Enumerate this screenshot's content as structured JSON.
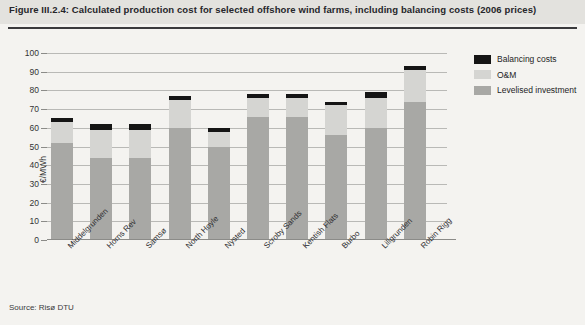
{
  "header": {
    "title": "Figure III.2.4: Calculated production cost for selected offshore wind farms, including balancing costs (2006 prices)"
  },
  "source": {
    "note": "Source: Risø DTU"
  },
  "legend": {
    "position": "top-right",
    "items": [
      {
        "label": "Balancing costs",
        "color": "#151515"
      },
      {
        "label": "O&M",
        "color": "#d5d5d2"
      },
      {
        "label": "Levelised investment",
        "color": "#a8a8a5"
      }
    ]
  },
  "axis": {
    "ylabel": "€/MWh",
    "yticks": [
      "0",
      "10",
      "20",
      "30",
      "40",
      "50",
      "60",
      "70",
      "80",
      "90",
      "100"
    ]
  },
  "chart_data": {
    "type": "bar",
    "title": "Calculated production cost for selected offshore wind farms, including balancing costs (2006 prices)",
    "subtitle": "",
    "xlabel": "",
    "ylabel": "€/MWh",
    "ylim": [
      0,
      100
    ],
    "ytick_step": 10,
    "grid": true,
    "stacked": true,
    "legend_position": "top-right",
    "categories": [
      "Middelgrunden",
      "Horns Rev",
      "Samsø",
      "North Hoyle",
      "Nysted",
      "Scroby Sands",
      "Kentish Flats",
      "Burbo",
      "Lillgrunden",
      "Robin Rigg"
    ],
    "series": [
      {
        "name": "Levelised investment",
        "color": "#a8a8a5",
        "values": [
          52,
          44,
          44,
          60,
          50,
          66,
          66,
          56,
          60,
          74
        ]
      },
      {
        "name": "O&M",
        "color": "#d5d5d2",
        "values": [
          11,
          15,
          15,
          15,
          8,
          10,
          10,
          16,
          16,
          17
        ]
      },
      {
        "name": "Balancing costs",
        "color": "#151515",
        "values": [
          2,
          3,
          3,
          2,
          2,
          2,
          2,
          2,
          3,
          2
        ]
      }
    ],
    "totals": [
      65,
      62,
      62,
      77,
      60,
      78,
      78,
      74,
      79,
      93
    ],
    "units": "€/MWh",
    "annotations": []
  }
}
